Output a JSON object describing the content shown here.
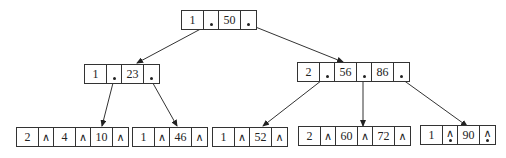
{
  "diagram": {
    "type": "B-tree",
    "null_pointer_symbol": "∧",
    "nodes": {
      "root": {
        "count": "1",
        "keys": [
          "50"
        ]
      },
      "mid_left": {
        "count": "1",
        "keys": [
          "23"
        ]
      },
      "mid_right": {
        "count": "2",
        "keys": [
          "56",
          "86"
        ]
      },
      "leaf1": {
        "count": "2",
        "keys": [
          "2",
          "4",
          "10"
        ]
      },
      "leaf2": {
        "count": "1",
        "keys": [
          "46"
        ]
      },
      "leaf3": {
        "count": "1",
        "keys": [
          "52"
        ]
      },
      "leaf4": {
        "count": "2",
        "keys": [
          "60",
          "72"
        ]
      },
      "leaf5": {
        "count": "1",
        "keys": [
          "90"
        ]
      }
    },
    "edges": [
      {
        "from": "root.ptr0",
        "to": "mid_left"
      },
      {
        "from": "root.ptr1",
        "to": "mid_right"
      },
      {
        "from": "mid_left.ptr0",
        "to": "leaf1"
      },
      {
        "from": "mid_left.ptr1",
        "to": "leaf2"
      },
      {
        "from": "mid_right.ptr0",
        "to": "leaf3"
      },
      {
        "from": "mid_right.ptr1",
        "to": "leaf4"
      },
      {
        "from": "mid_right.ptr2",
        "to": "leaf5"
      }
    ]
  }
}
